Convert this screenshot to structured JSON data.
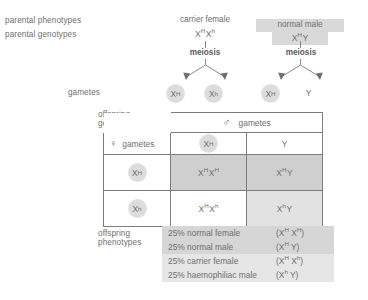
{
  "diagram": {
    "row_labels": {
      "parental_phenotypes": "parental phenotypes",
      "parental_genotypes": "parental genotypes",
      "gametes": "gametes",
      "offspring_genotypes_line1": "offspring",
      "offspring_genotypes_line2": "genotypes",
      "offspring_phenotypes_line1": "offspring",
      "offspring_phenotypes_line2": "phenotypes"
    },
    "parents": {
      "female": {
        "phenotype": "carrier female",
        "genotype_x1": "X",
        "genotype_sup1": "H",
        "genotype_x2": "X",
        "genotype_sup2": "h",
        "meiosis": "meiosis",
        "highlighted": false
      },
      "male": {
        "phenotype": "normal male",
        "genotype_x1": "X",
        "genotype_sup1": "H",
        "genotype_x2": "Y",
        "meiosis": "meiosis",
        "highlighted": true
      }
    },
    "gametes": {
      "female": [
        {
          "symbol": "X",
          "sup": "H",
          "circled": true
        },
        {
          "symbol": "X",
          "sup": "h",
          "circled": true
        }
      ],
      "male": [
        {
          "symbol": "X",
          "sup": "H",
          "circled": true
        },
        {
          "symbol": "Y",
          "sup": "",
          "circled": false
        }
      ]
    },
    "punnett": {
      "male_header": "gametes",
      "male_symbol": "♂",
      "female_header": "gametes",
      "female_symbol": "♀",
      "col_headers": [
        {
          "symbol": "X",
          "sup": "H",
          "circled": true
        },
        {
          "symbol": "Y",
          "sup": "",
          "circled": false
        }
      ],
      "row_headers": [
        {
          "symbol": "X",
          "sup": "H",
          "circled": true
        },
        {
          "symbol": "X",
          "sup": "h",
          "circled": true
        }
      ],
      "cells": [
        [
          {
            "x1": "X",
            "s1": "H",
            "x2": "X",
            "s2": "H",
            "shade": "dark"
          },
          {
            "x1": "X",
            "s1": "H",
            "x2": "Y",
            "s2": "",
            "shade": "dark"
          }
        ],
        [
          {
            "x1": "X",
            "s1": "H",
            "x2": "X",
            "s2": "h",
            "shade": "none"
          },
          {
            "x1": "X",
            "s1": "h",
            "x2": "Y",
            "s2": "",
            "shade": "light"
          }
        ]
      ]
    },
    "phenotypes": [
      {
        "percent": "25% normal female",
        "genotype_open": "(X",
        "s1": "H",
        "mid": " X",
        "s2": "H",
        "close": ")",
        "shade": "dark"
      },
      {
        "percent": "25% normal male",
        "genotype_open": "(X",
        "s1": "H",
        "mid": " Y",
        "s2": "",
        "close": ")",
        "shade": "dark"
      },
      {
        "percent": "25% carrier female",
        "genotype_open": "(X",
        "s1": "H",
        "mid": " X",
        "s2": "h",
        "close": ")",
        "shade": "light"
      },
      {
        "percent": "25% haemophiliac male",
        "genotype_open": "(X",
        "s1": "h",
        "mid": " Y",
        "s2": "",
        "close": ")",
        "shade": "light"
      }
    ],
    "colors": {
      "text": "#6f6f6f",
      "border": "#7c7c7c",
      "highlight": "#d9d9d9",
      "shade_dark": "#cfcfcf",
      "shade_light": "#e2e2e2",
      "bubble": "#dcdcdc"
    }
  }
}
